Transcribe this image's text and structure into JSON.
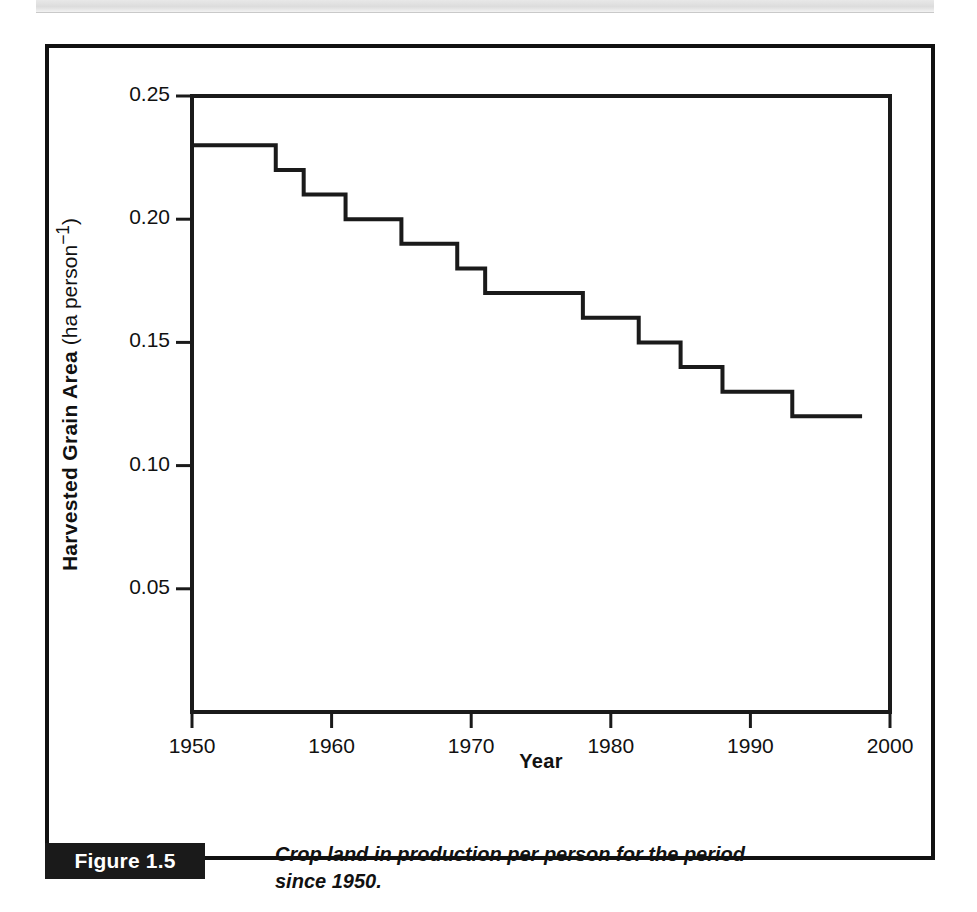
{
  "figure": {
    "number_label": "Figure 1.5",
    "caption": "Crop land in production per person for the period since 1950."
  },
  "chart_data": {
    "type": "line",
    "title": "",
    "xlabel": "Year",
    "ylabel_bold": "Harvested Grain Area",
    "ylabel_unit": "(ha person",
    "ylabel_unit_sup": "−1",
    "ylabel_unit_close": ")",
    "xlim": [
      1950,
      2000
    ],
    "ylim": [
      0.0,
      0.25
    ],
    "xticks": [
      1950,
      1960,
      1970,
      1980,
      1990,
      2000
    ],
    "xtick_labels": [
      "1950",
      "1960",
      "1970",
      "1980",
      "1990",
      "2000"
    ],
    "yticks": [
      0.05,
      0.1,
      0.15,
      0.2,
      0.25
    ],
    "ytick_labels": [
      "0.05",
      "0.10",
      "0.15",
      "0.20",
      "0.25"
    ],
    "grid": false,
    "legend": false,
    "line_color": "#1a1a1a",
    "line_width": 4,
    "drawstyle": "steps-post",
    "x": [
      1950,
      1951,
      1952,
      1953,
      1954,
      1955,
      1956,
      1957,
      1958,
      1959,
      1960,
      1961,
      1962,
      1963,
      1964,
      1965,
      1966,
      1967,
      1968,
      1969,
      1970,
      1971,
      1972,
      1973,
      1974,
      1975,
      1976,
      1977,
      1978,
      1979,
      1980,
      1981,
      1982,
      1983,
      1984,
      1985,
      1986,
      1987,
      1988,
      1989,
      1990,
      1991,
      1992,
      1993,
      1994,
      1995,
      1996,
      1997
    ],
    "values": [
      0.23,
      0.23,
      0.23,
      0.23,
      0.23,
      0.23,
      0.22,
      0.22,
      0.21,
      0.21,
      0.21,
      0.2,
      0.2,
      0.2,
      0.2,
      0.19,
      0.19,
      0.19,
      0.19,
      0.18,
      0.18,
      0.17,
      0.17,
      0.17,
      0.17,
      0.17,
      0.17,
      0.17,
      0.16,
      0.16,
      0.16,
      0.16,
      0.15,
      0.15,
      0.15,
      0.14,
      0.14,
      0.14,
      0.13,
      0.13,
      0.13,
      0.13,
      0.13,
      0.12,
      0.12,
      0.12,
      0.12,
      0.12
    ]
  }
}
